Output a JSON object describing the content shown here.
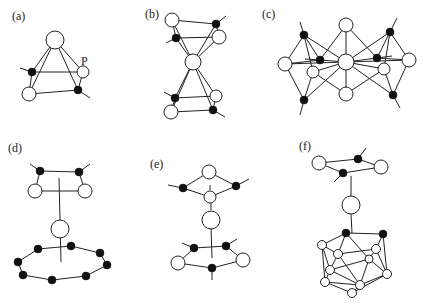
{
  "figure": {
    "panels": [
      {
        "id": "a",
        "label": "(a)",
        "atom_label": "P",
        "description": "Tetrahedral cluster: one apex open atom above a ring of two open and two filled atoms"
      },
      {
        "id": "b",
        "label": "(b)",
        "description": "Central open atom sandwiched between two four-membered rings of open and filled atoms"
      },
      {
        "id": "c",
        "label": "(c)",
        "description": "Central open atom bridging two fused polyhedral units with open and filled atoms"
      },
      {
        "id": "d",
        "label": "(d)",
        "description": "Four-membered ring above a central open atom above an eight-membered ring of filled atoms"
      },
      {
        "id": "e",
        "label": "(e)",
        "description": "Four-membered ring above a central open atom above a five-membered ring"
      },
      {
        "id": "f",
        "label": "(f)",
        "description": "Four-membered ring above a central open atom above a carborane-like icosahedral cage"
      }
    ],
    "legend": {
      "open_circle": "open atom",
      "filled_circle": "filled atom"
    },
    "colors": {
      "line": "#222222",
      "filled_atom": "#111111",
      "open_atom_fill": "#ffffff"
    }
  }
}
